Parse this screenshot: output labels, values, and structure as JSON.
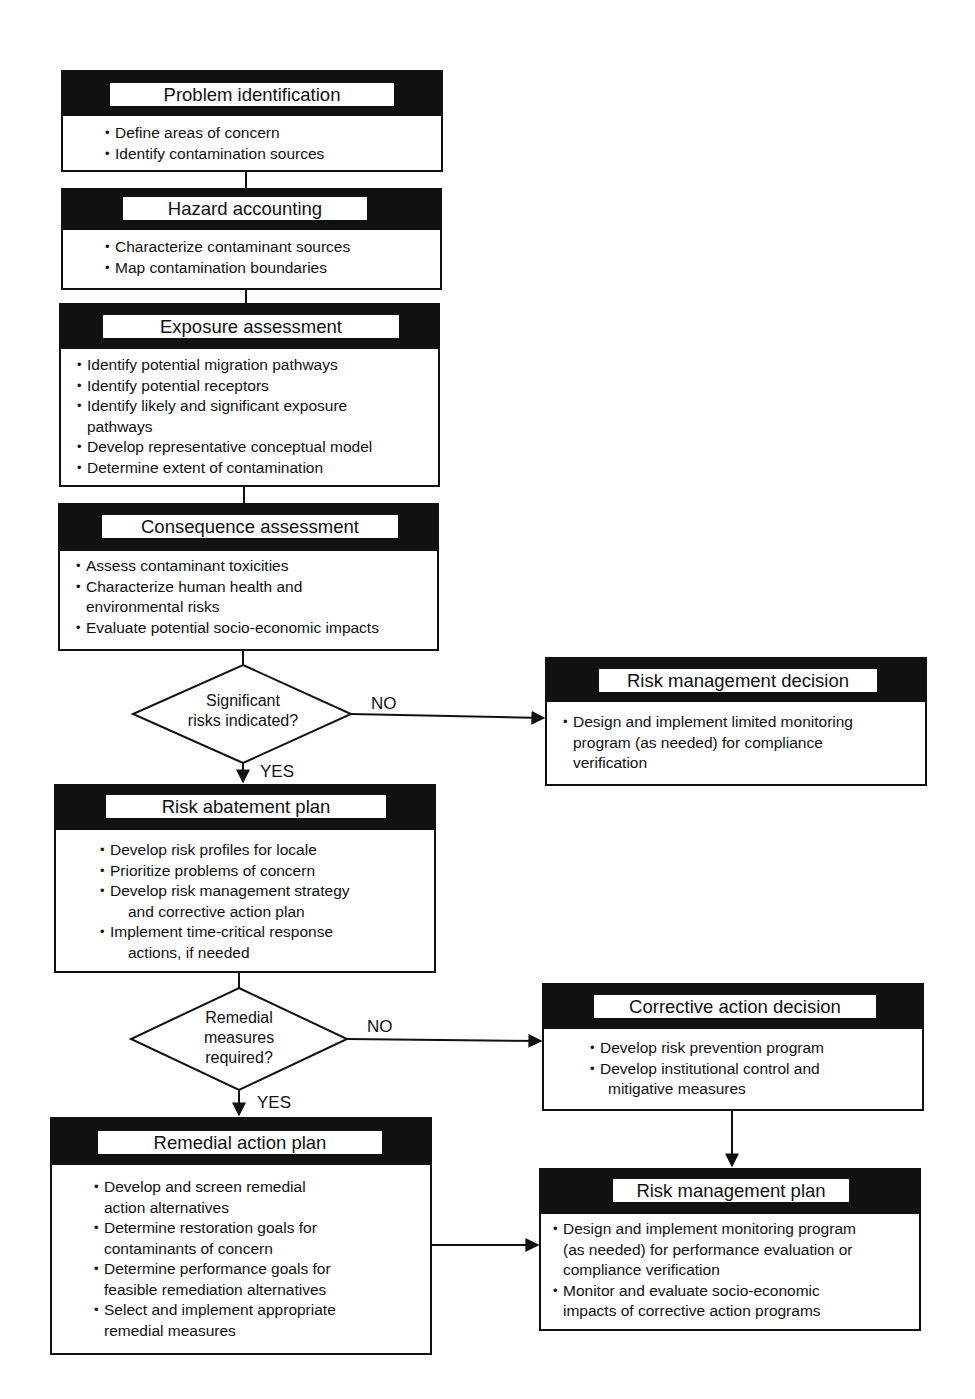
{
  "boxes": {
    "problem_identification": {
      "title": "Problem identification",
      "items": [
        [
          "Define areas of concern"
        ],
        [
          "Identify contamination sources"
        ]
      ]
    },
    "hazard_accounting": {
      "title": "Hazard accounting",
      "items": [
        [
          "Characterize contaminant sources"
        ],
        [
          "Map contamination boundaries"
        ]
      ]
    },
    "exposure_assessment": {
      "title": "Exposure assessment",
      "items": [
        [
          "Identify potential migration pathways"
        ],
        [
          "Identify potential receptors"
        ],
        [
          "Identify likely and significant exposure",
          "pathways"
        ],
        [
          "Develop representative conceptual model"
        ],
        [
          "Determine extent of contamination"
        ]
      ]
    },
    "consequence_assessment": {
      "title": "Consequence assessment",
      "items": [
        [
          "Assess contaminant toxicities"
        ],
        [
          "Characterize human health and",
          "environmental risks"
        ],
        [
          "Evaluate potential socio-economic impacts"
        ]
      ]
    },
    "risk_management_decision": {
      "title": "Risk management decision",
      "items": [
        [
          "Design and implement limited monitoring",
          "program (as needed) for compliance",
          "verification"
        ]
      ]
    },
    "risk_abatement_plan": {
      "title": "Risk abatement plan",
      "items": [
        [
          "Develop risk profiles for locale"
        ],
        [
          "Prioritize problems of concern"
        ],
        [
          "Develop risk management strategy",
          "and corrective action plan"
        ],
        [
          "Implement time-critical response",
          "actions, if needed"
        ]
      ]
    },
    "corrective_action_decision": {
      "title": "Corrective action decision",
      "items": [
        [
          "Develop risk prevention program"
        ],
        [
          "Develop institutional control and",
          "mitigative measures"
        ]
      ]
    },
    "remedial_action_plan": {
      "title": "Remedial action plan",
      "items": [
        [
          "Develop and screen remedial",
          "action alternatives"
        ],
        [
          "Determine restoration goals for",
          "contaminants of concern"
        ],
        [
          "Determine performance goals for",
          "feasible remediation alternatives"
        ],
        [
          "Select and implement appropriate",
          "remedial measures"
        ]
      ]
    },
    "risk_management_plan": {
      "title": "Risk management plan",
      "items": [
        [
          "Design and implement monitoring program",
          "(as needed) for performance evaluation or",
          "compliance verification"
        ],
        [
          "Monitor and evaluate socio-economic",
          "impacts of corrective action programs"
        ]
      ]
    }
  },
  "decisions": {
    "significant_risks": {
      "lines": [
        "Significant",
        "risks indicated?"
      ],
      "yes_label": "YES",
      "no_label": "NO"
    },
    "remedial_measures": {
      "lines": [
        "Remedial",
        "measures",
        "required?"
      ],
      "yes_label": "YES",
      "no_label": "NO"
    }
  },
  "colors": {
    "ink": "#111111",
    "background": "#ffffff"
  }
}
